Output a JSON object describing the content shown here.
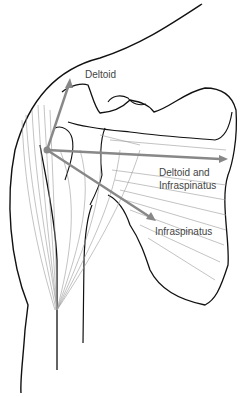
{
  "figure": {
    "labels": {
      "deltoid": "Deltoid",
      "deltoid_infraspinatus_line1": "Deltoid and",
      "deltoid_infraspinatus_line2": "Infraspinatus",
      "infraspinatus": "Infraspinatus"
    },
    "colors": {
      "outline": "#111111",
      "fibers": "#9a9a9a",
      "arrows": "#888888",
      "label_text": "#444444",
      "background": "#ffffff"
    },
    "vectors": [
      {
        "name": "Deltoid",
        "from": [
          47,
          150
        ],
        "to": [
          70,
          80
        ]
      },
      {
        "name": "Deltoid and Infraspinatus",
        "from": [
          47,
          150
        ],
        "to": [
          226,
          159
        ]
      },
      {
        "name": "Infraspinatus",
        "from": [
          47,
          150
        ],
        "to": [
          156,
          221
        ]
      }
    ]
  }
}
